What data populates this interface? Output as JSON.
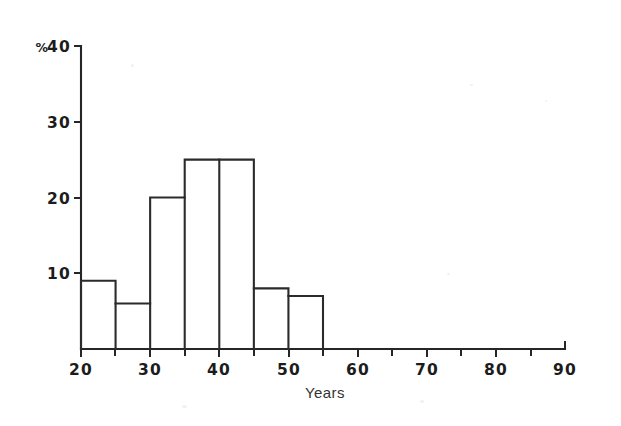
{
  "chart_data": {
    "type": "bar",
    "title": "",
    "subtitle": "",
    "xlabel": "Years",
    "ylabel": "%",
    "xlim": [
      20,
      90
    ],
    "ylim": [
      0,
      40
    ],
    "grid": false,
    "legend": false,
    "bin_width": 5,
    "categories": [
      "20-25",
      "25-30",
      "30-35",
      "35-40",
      "40-45",
      "45-50",
      "50-55"
    ],
    "bin_edges": [
      20,
      25,
      30,
      35,
      40,
      45,
      50,
      55
    ],
    "values": [
      9,
      6,
      20,
      25,
      25,
      8,
      7
    ],
    "series": [
      {
        "name": "Percent",
        "values": [
          9,
          6,
          20,
          25,
          25,
          8,
          7
        ]
      }
    ],
    "x_ticks_major": [
      20,
      30,
      40,
      50,
      60,
      70,
      80,
      90
    ],
    "x_tick_labels": [
      "20",
      "30",
      "40",
      "50",
      "60",
      "70",
      "80",
      "90"
    ],
    "x_ticks_minor": [
      25,
      35,
      45,
      55,
      65,
      75,
      85
    ],
    "y_ticks": [
      10,
      20,
      30,
      40
    ],
    "y_tick_labels": [
      "10",
      "20",
      "30",
      "40"
    ],
    "y_top_label": "40",
    "y_unit_symbol": "%",
    "colors": {
      "axis": "#262626",
      "bar_outline": "#2b2b2b",
      "bar_fill": "none",
      "text": "#1c1c1c",
      "background": "#ffffff"
    }
  },
  "figure": {
    "x_axis_title": "Years",
    "y_axis_unit": "%",
    "y_label_40": "40",
    "y_label_30": "30",
    "y_label_20": "20",
    "y_label_10": "10",
    "x_label_20": "20",
    "x_label_30": "30",
    "x_label_40": "40",
    "x_label_50": "50",
    "x_label_60": "60",
    "x_label_70": "70",
    "x_label_80": "80",
    "x_label_90": "90"
  }
}
